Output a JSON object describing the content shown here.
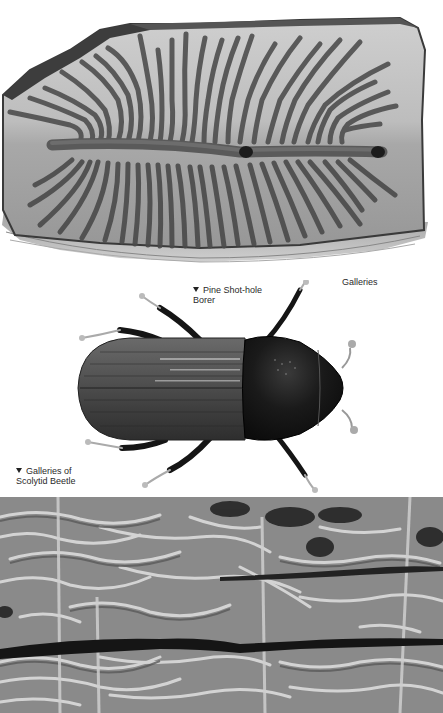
{
  "page": {
    "background": "#ffffff",
    "tone": "grayscale"
  },
  "figures": {
    "top": {
      "subject": "gallery engraving on bark with central maternal gallery and radiating larval galleries",
      "caption": "Galleries"
    },
    "middle": {
      "subject": "beetle illustration, dorsal view",
      "caption_line1": "Pine Shot-hole",
      "caption_line2": "Borer"
    },
    "bottom": {
      "subject": "photograph of wood surface covered with scolytid beetle galleries",
      "caption_line1": "Galleries of",
      "caption_line2": "Scolytid Beetle"
    }
  },
  "icons": {
    "pointer_marker": "down-triangle-icon"
  },
  "colors": {
    "text": "#2a2a2a",
    "bark_light": "#c9c9c9",
    "bark_mid": "#9a9a9a",
    "bark_dark": "#3a3a3a",
    "beetle_elytra": "#4a4a4a",
    "beetle_pronotum": "#141414"
  }
}
